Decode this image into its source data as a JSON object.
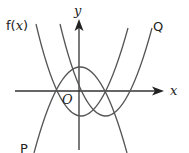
{
  "diagram": {
    "type": "function-graph",
    "axes": {
      "x_label": "x",
      "y_label": "y",
      "origin_label": "O"
    },
    "curves": [
      {
        "name": "f(x)",
        "label": "f(x)",
        "label_prefix": "f(",
        "label_var": "x",
        "label_suffix": ")",
        "shape": "upward parabola",
        "vertex_note": "minimum on y-axis below origin"
      },
      {
        "name": "Q",
        "label": "Q",
        "shape": "upward parabola",
        "vertex_note": "f(x) translated right"
      },
      {
        "name": "P",
        "label": "P",
        "shape": "downward parabola",
        "vertex_note": "f(x) reflected in x-axis"
      }
    ],
    "colors": {
      "curve": "#555555",
      "axis": "#333333",
      "text": "#222222"
    }
  }
}
